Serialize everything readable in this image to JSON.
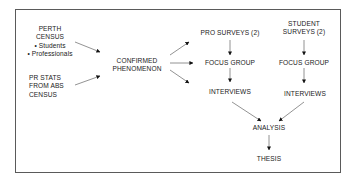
{
  "diagram": {
    "nodes": {
      "perth_census": {
        "title_1": "PERTH",
        "title_2": "CENSUS",
        "bullets": [
          "• Students",
          "• Professionals"
        ]
      },
      "pr_stats": {
        "line_1": "PR STATS",
        "line_2": "FROM ABS",
        "line_3": "CENSUS"
      },
      "confirmed": {
        "line_1": "CONFIRMED",
        "line_2": "PHENOMENON"
      },
      "pro_surveys": {
        "label": "PRO SURVEYS (2)"
      },
      "student_surveys": {
        "line_1": "STUDENT",
        "line_2": "SURVEYS (2)"
      },
      "focus_group_pro": {
        "label": "FOCUS GROUP"
      },
      "focus_group_student": {
        "label": "FOCUS GROUP"
      },
      "interviews_pro": {
        "label": "INTERVIEWS"
      },
      "interviews_student": {
        "label": "INTERVIEWS"
      },
      "analysis": {
        "label": "ANALYSIS"
      },
      "thesis": {
        "label": "THESIS"
      }
    },
    "edges": [
      [
        "perth_census",
        "confirmed"
      ],
      [
        "pr_stats",
        "confirmed"
      ],
      [
        "confirmed",
        "pro_surveys"
      ],
      [
        "confirmed",
        "focus_group_pro"
      ],
      [
        "confirmed",
        "interviews_pro"
      ],
      [
        "pro_surveys",
        "focus_group_pro"
      ],
      [
        "focus_group_pro",
        "interviews_pro"
      ],
      [
        "student_surveys",
        "focus_group_student"
      ],
      [
        "focus_group_student",
        "interviews_student"
      ],
      [
        "interviews_pro",
        "analysis"
      ],
      [
        "interviews_student",
        "analysis"
      ],
      [
        "analysis",
        "thesis"
      ]
    ],
    "colors": {
      "text": "#1a1a1a",
      "line": "#555555",
      "frame": "#5a5a5a"
    }
  }
}
